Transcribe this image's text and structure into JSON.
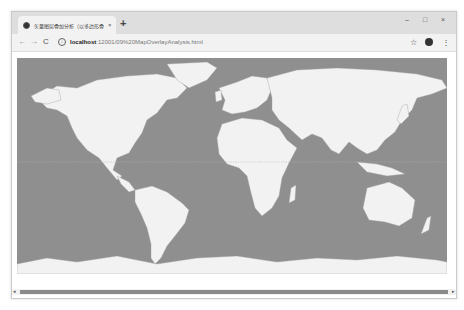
{
  "browser": {
    "tab": {
      "title": "矢量图层叠加分析（以多边形叠加…",
      "favicon": "globe-icon",
      "close_glyph": "×"
    },
    "new_tab_glyph": "+",
    "window_controls": {
      "minimize": "–",
      "maximize": "□",
      "close": "×"
    },
    "nav": {
      "back": "←",
      "forward": "→",
      "reload": "C"
    },
    "address": {
      "info_glyph": "i",
      "host": "localhost",
      "path": ":12001/09%20MapOverlayAnalysis.html"
    },
    "bookmark_glyph": "☆",
    "menu_glyph": "⋮"
  },
  "map": {
    "description": "World map (vector layer) with country boundaries",
    "ocean_color": "#8f8f8f",
    "land_color": "#f2f2f2",
    "border_color": "#a0a0a0"
  },
  "scrollbar": {
    "left_arrow": "◂",
    "right_arrow": "▸"
  }
}
